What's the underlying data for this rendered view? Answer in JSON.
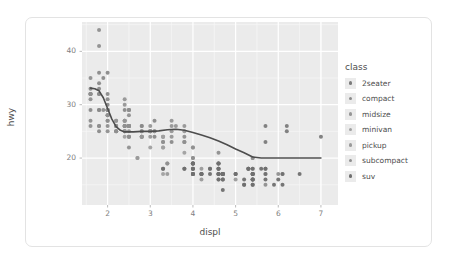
{
  "panel": {
    "background": "#ebebeb",
    "grid_major": "#ffffff",
    "grid_minor": "#f7f7f7",
    "left": 82,
    "top": 22,
    "width": 256,
    "height": 183
  },
  "axes": {
    "x": {
      "label": "displ",
      "ticks": [
        "2",
        "3",
        "4",
        "5",
        "6",
        "7"
      ],
      "tick_values": [
        2,
        3,
        4,
        5,
        6,
        7
      ],
      "range": [
        1.4,
        7.4
      ]
    },
    "y": {
      "label": "hwy",
      "ticks": [
        "20",
        "30",
        "40"
      ],
      "tick_values": [
        20,
        30,
        40
      ],
      "range": [
        11.2,
        45.5
      ]
    }
  },
  "legend": {
    "title": "class",
    "items": [
      {
        "label": "2seater",
        "color": "#7b7b7b"
      },
      {
        "label": "compact",
        "color": "#8a8a8a"
      },
      {
        "label": "midsize",
        "color": "#969696"
      },
      {
        "label": "minivan",
        "color": "#a0a0a0"
      },
      {
        "label": "pickup",
        "color": "#9a9a9a"
      },
      {
        "label": "subcompact",
        "color": "#8f8f8f"
      },
      {
        "label": "suv",
        "color": "#6f6f6f"
      }
    ]
  },
  "smooth": {
    "color": "#4d4d4d",
    "width": 1.6,
    "x": [
      1.6,
      1.7,
      1.8,
      1.9,
      2.0,
      2.1,
      2.2,
      2.3,
      2.4,
      2.5,
      2.6,
      2.8,
      3.0,
      3.2,
      3.4,
      3.6,
      3.8,
      4.0,
      4.2,
      4.4,
      4.6,
      4.8,
      5.0,
      5.2,
      5.4,
      5.6,
      5.8,
      6.0,
      6.2,
      6.4,
      6.6,
      6.8,
      7.0
    ],
    "y": [
      33.1,
      33.0,
      32.6,
      31.3,
      29.3,
      27.3,
      25.9,
      25.2,
      24.9,
      24.9,
      24.9,
      25.0,
      25.0,
      25.1,
      25.3,
      25.4,
      25.2,
      24.8,
      24.3,
      23.8,
      23.2,
      22.5,
      21.7,
      21.0,
      20.2,
      20.0,
      20.0,
      20.0,
      20.0,
      20.0,
      20.0,
      20.0,
      20.0
    ]
  },
  "chart_data": {
    "type": "scatter",
    "title": "",
    "xlabel": "displ",
    "ylabel": "hwy",
    "xlim": [
      1.4,
      7.4
    ],
    "ylim": [
      11.2,
      45.5
    ],
    "grid": true,
    "legend_position": "right",
    "legend_title": "class",
    "series": [
      {
        "name": "2seater",
        "color": "#7b7b7b",
        "points": [
          [
            5.7,
            26
          ],
          [
            5.7,
            23
          ],
          [
            6.2,
            26
          ],
          [
            6.2,
            25
          ],
          [
            7.0,
            24
          ]
        ]
      },
      {
        "name": "compact",
        "color": "#8a8a8a",
        "points": [
          [
            1.8,
            29
          ],
          [
            1.8,
            29
          ],
          [
            2.0,
            31
          ],
          [
            2.0,
            30
          ],
          [
            2.8,
            26
          ],
          [
            2.8,
            26
          ],
          [
            3.1,
            27
          ],
          [
            1.8,
            26
          ],
          [
            1.8,
            25
          ],
          [
            2.0,
            28
          ],
          [
            2.0,
            27
          ],
          [
            2.8,
            25
          ],
          [
            2.8,
            25
          ],
          [
            3.1,
            25
          ],
          [
            1.6,
            33
          ],
          [
            1.6,
            32
          ],
          [
            1.6,
            32
          ],
          [
            1.6,
            29
          ],
          [
            1.6,
            32
          ],
          [
            1.8,
            34
          ],
          [
            1.8,
            36
          ],
          [
            2.0,
            36
          ],
          [
            2.4,
            29
          ],
          [
            2.4,
            26
          ],
          [
            2.5,
            26
          ],
          [
            2.5,
            26
          ],
          [
            1.8,
            33
          ],
          [
            1.8,
            32
          ],
          [
            1.8,
            32
          ],
          [
            2.0,
            29
          ],
          [
            2.0,
            32
          ],
          [
            2.8,
            24
          ],
          [
            2.8,
            24
          ],
          [
            3.1,
            24
          ],
          [
            1.9,
            35
          ],
          [
            2.0,
            29
          ],
          [
            2.0,
            29
          ],
          [
            2.5,
            26
          ],
          [
            2.5,
            26
          ],
          [
            2.2,
            26
          ],
          [
            2.2,
            25
          ],
          [
            2.4,
            27
          ],
          [
            2.4,
            25
          ],
          [
            3.0,
            25
          ],
          [
            3.0,
            25
          ],
          [
            3.5,
            23
          ],
          [
            2.2,
            27
          ],
          [
            2.2,
            25
          ]
        ]
      },
      {
        "name": "midsize",
        "color": "#969696",
        "points": [
          [
            2.4,
            27
          ],
          [
            2.4,
            26
          ],
          [
            3.1,
            25
          ],
          [
            3.5,
            25
          ],
          [
            2.4,
            27
          ],
          [
            2.4,
            25
          ],
          [
            3.0,
            25
          ],
          [
            3.0,
            25
          ],
          [
            3.5,
            24
          ],
          [
            2.2,
            26
          ],
          [
            2.2,
            27
          ],
          [
            2.4,
            26
          ],
          [
            2.4,
            25
          ],
          [
            3.0,
            25
          ],
          [
            3.0,
            24
          ],
          [
            3.5,
            27
          ],
          [
            2.4,
            31
          ],
          [
            2.4,
            26
          ],
          [
            2.5,
            26
          ],
          [
            3.3,
            24
          ],
          [
            2.0,
            28
          ],
          [
            2.0,
            29
          ],
          [
            2.8,
            24
          ],
          [
            2.8,
            24
          ],
          [
            3.6,
            26
          ],
          [
            2.4,
            30
          ],
          [
            3.0,
            26
          ],
          [
            3.3,
            23
          ],
          [
            3.5,
            26
          ],
          [
            3.8,
            25
          ],
          [
            3.8,
            26
          ]
        ]
      },
      {
        "name": "minivan",
        "color": "#a0a0a0",
        "points": [
          [
            2.4,
            24
          ],
          [
            3.0,
            22
          ],
          [
            3.3,
            22
          ],
          [
            3.3,
            24
          ],
          [
            3.3,
            24
          ],
          [
            3.3,
            17
          ],
          [
            3.3,
            22
          ],
          [
            3.8,
            21
          ],
          [
            3.8,
            23
          ],
          [
            3.8,
            23
          ],
          [
            4.0,
            22
          ]
        ]
      },
      {
        "name": "pickup",
        "color": "#9a9a9a",
        "points": [
          [
            2.7,
            20
          ],
          [
            2.7,
            20
          ],
          [
            3.4,
            19
          ],
          [
            3.4,
            17
          ],
          [
            4.0,
            20
          ],
          [
            4.0,
            17
          ],
          [
            4.0,
            19
          ],
          [
            4.0,
            19
          ],
          [
            4.6,
            19
          ],
          [
            5.0,
            17
          ],
          [
            4.2,
            17
          ],
          [
            4.2,
            17
          ],
          [
            4.6,
            16
          ],
          [
            4.6,
            17
          ],
          [
            4.6,
            17
          ],
          [
            5.4,
            17
          ],
          [
            5.4,
            18
          ],
          [
            5.4,
            17
          ],
          [
            4.0,
            17
          ],
          [
            4.0,
            19
          ],
          [
            4.6,
            17
          ],
          [
            5.0,
            16
          ],
          [
            4.2,
            18
          ],
          [
            4.2,
            16
          ],
          [
            4.6,
            17
          ],
          [
            4.6,
            17
          ],
          [
            4.7,
            16
          ],
          [
            4.7,
            16
          ],
          [
            4.7,
            17
          ],
          [
            5.7,
            17
          ],
          [
            6.1,
            17
          ]
        ]
      },
      {
        "name": "subcompact",
        "color": "#8f8f8f",
        "points": [
          [
            1.8,
            44
          ],
          [
            1.8,
            41
          ],
          [
            1.9,
            29
          ],
          [
            2.0,
            26
          ],
          [
            2.0,
            28
          ],
          [
            2.5,
            29
          ],
          [
            2.5,
            29
          ],
          [
            2.5,
            28
          ],
          [
            2.5,
            29
          ],
          [
            3.3,
            23
          ],
          [
            2.0,
            29
          ],
          [
            2.0,
            27
          ],
          [
            2.5,
            24
          ],
          [
            2.5,
            24
          ],
          [
            2.2,
            26
          ],
          [
            2.2,
            25
          ],
          [
            2.5,
            24
          ],
          [
            2.5,
            22
          ],
          [
            2.5,
            26
          ],
          [
            2.5,
            25
          ],
          [
            3.8,
            23
          ],
          [
            4.0,
            22
          ],
          [
            4.0,
            20
          ],
          [
            4.6,
            19
          ],
          [
            5.4,
            20
          ],
          [
            5.4,
            20
          ],
          [
            1.6,
            35
          ],
          [
            1.6,
            31
          ],
          [
            1.6,
            32
          ],
          [
            1.6,
            27
          ],
          [
            1.6,
            26
          ],
          [
            1.8,
            26
          ],
          [
            2.0,
            25
          ],
          [
            2.4,
            26
          ],
          [
            3.4,
            19
          ],
          [
            5.7,
            15
          ],
          [
            6.0,
            17
          ],
          [
            5.4,
            16
          ],
          [
            3.8,
            24
          ],
          [
            4.6,
            21
          ]
        ]
      },
      {
        "name": "suv",
        "color": "#6f6f6f",
        "points": [
          [
            4.0,
            18
          ],
          [
            4.2,
            17
          ],
          [
            4.4,
            17
          ],
          [
            4.6,
            18
          ],
          [
            5.4,
            17
          ],
          [
            5.4,
            17
          ],
          [
            4.0,
            18
          ],
          [
            4.7,
            17
          ],
          [
            4.7,
            17
          ],
          [
            4.7,
            17
          ],
          [
            5.2,
            15
          ],
          [
            5.2,
            15
          ],
          [
            5.7,
            16
          ],
          [
            5.9,
            15
          ],
          [
            4.6,
            17
          ],
          [
            5.4,
            15
          ],
          [
            5.4,
            15
          ],
          [
            4.0,
            19
          ],
          [
            4.0,
            19
          ],
          [
            4.6,
            18
          ],
          [
            5.0,
            17
          ],
          [
            4.0,
            17
          ],
          [
            4.0,
            19
          ],
          [
            4.6,
            19
          ],
          [
            5.0,
            17
          ],
          [
            4.7,
            14
          ],
          [
            4.7,
            17
          ],
          [
            4.7,
            17
          ],
          [
            5.7,
            18
          ],
          [
            6.1,
            15
          ],
          [
            4.6,
            17
          ],
          [
            5.4,
            17
          ],
          [
            3.3,
            18
          ],
          [
            3.3,
            18
          ],
          [
            3.8,
            18
          ],
          [
            3.8,
            18
          ],
          [
            4.0,
            18
          ],
          [
            4.0,
            17
          ],
          [
            4.6,
            16
          ],
          [
            5.4,
            16
          ],
          [
            6.5,
            17
          ],
          [
            4.7,
            17
          ],
          [
            4.7,
            16
          ],
          [
            5.2,
            16
          ],
          [
            4.2,
            17
          ],
          [
            4.4,
            18
          ],
          [
            5.3,
            18
          ],
          [
            5.3,
            18
          ],
          [
            5.3,
            18
          ],
          [
            5.7,
            17
          ],
          [
            6.0,
            16
          ],
          [
            5.6,
            18
          ],
          [
            5.7,
            18
          ],
          [
            6.1,
            17
          ],
          [
            4.0,
            17
          ],
          [
            4.2,
            17
          ],
          [
            4.4,
            18
          ],
          [
            4.6,
            18
          ],
          [
            5.4,
            17
          ],
          [
            5.4,
            18
          ],
          [
            4.6,
            19
          ],
          [
            5.4,
            16
          ],
          [
            5.4,
            16
          ]
        ]
      }
    ]
  }
}
